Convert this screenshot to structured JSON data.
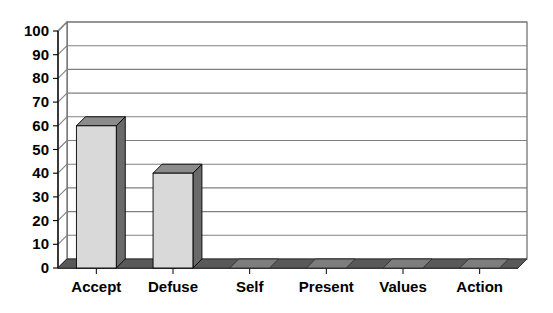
{
  "chart_data": {
    "type": "bar",
    "title": "",
    "subtitle": "",
    "xlabel": "",
    "ylabel": "",
    "categories": [
      "Accept",
      "Defuse",
      "Self",
      "Present",
      "Values",
      "Action"
    ],
    "values": [
      60,
      40,
      0,
      0,
      0,
      0
    ],
    "series": [
      {
        "name": "Series 1",
        "values": [
          60,
          40,
          0,
          0,
          0,
          0
        ]
      }
    ],
    "ylim": [
      0,
      100
    ],
    "ytick_labels": [
      "0",
      "10",
      "20",
      "30",
      "40",
      "50",
      "60",
      "70",
      "80",
      "90",
      "100"
    ],
    "ytick_values": [
      0,
      10,
      20,
      30,
      40,
      50,
      60,
      70,
      80,
      90,
      100
    ],
    "grid": true,
    "grid_axis": "y",
    "legend": false,
    "legend_position": "none",
    "style": "3d-column",
    "annotations": [],
    "colors": {
      "bar_front": "#d9d9d9",
      "bar_side": "#6a6a6a",
      "bar_top": "#8c8c8c",
      "bar_outline": "#000000",
      "floor": "#595959",
      "grid_line": "#808080",
      "wall_line": "#595959",
      "axis_line": "#000000",
      "background": "#ffffff",
      "text": "#000000"
    }
  },
  "axis": {
    "y_labels": [
      "100",
      "90",
      "80",
      "70",
      "60",
      "50",
      "40",
      "30",
      "20",
      "10",
      "0"
    ],
    "x_labels": [
      "Accept",
      "Defuse",
      "Self",
      "Present",
      "Values",
      "Action"
    ]
  }
}
